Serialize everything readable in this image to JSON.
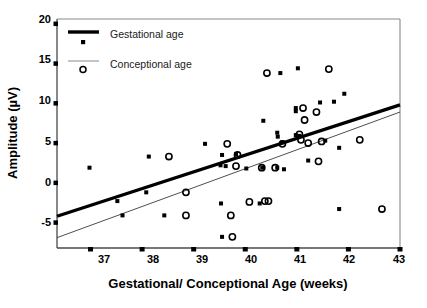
{
  "chart_data": {
    "type": "scatter",
    "title": "",
    "xlabel": "Gestational/ Conceptional Age (weeks)",
    "ylabel": "Amplitude (µV)",
    "xlim": [
      36.35,
      43.0
    ],
    "ylim": [
      -8.2,
      20.6
    ],
    "xticks": [
      37,
      38,
      39,
      40,
      41,
      42,
      43
    ],
    "xtick_labels": [
      "37",
      "38",
      "39",
      "40",
      "41",
      "42",
      "43"
    ],
    "yticks": [
      20,
      15,
      10,
      5,
      0,
      -5
    ],
    "ytick_labels": [
      "20",
      "15",
      "10",
      "5",
      "0",
      "-5"
    ],
    "grid": false,
    "legend_position": "top-left",
    "series": [
      {
        "name": "Gestational age",
        "marker": "square",
        "color": "#000000",
        "points": [
          [
            36.98,
            1.9
          ],
          [
            37.52,
            -2.3
          ],
          [
            37.62,
            -4.1
          ],
          [
            38.08,
            -1.2
          ],
          [
            38.13,
            3.3
          ],
          [
            38.43,
            -4.1
          ],
          [
            39.22,
            4.9
          ],
          [
            39.52,
            2.2
          ],
          [
            39.55,
            3.5
          ],
          [
            39.53,
            -2.6
          ],
          [
            39.55,
            -6.8
          ],
          [
            39.82,
            3.6
          ],
          [
            40.02,
            1.8
          ],
          [
            40.33,
            1.9
          ],
          [
            40.35,
            7.8
          ],
          [
            40.62,
            6.3
          ],
          [
            40.63,
            5.8
          ],
          [
            40.72,
            5.1
          ],
          [
            40.98,
            9.4
          ],
          [
            40.98,
            9.0
          ],
          [
            40.98,
            6.0
          ],
          [
            41.02,
            14.4
          ],
          [
            41.05,
            5.9
          ],
          [
            41.22,
            2.8
          ],
          [
            41.45,
            10.1
          ],
          [
            41.55,
            5.3
          ],
          [
            41.72,
            10.2
          ],
          [
            41.82,
            4.4
          ],
          [
            41.82,
            -3.3
          ],
          [
            41.92,
            11.2
          ],
          [
            40.68,
            13.8
          ],
          [
            39.62,
            2.1
          ],
          [
            40.62,
            1.9
          ],
          [
            40.75,
            1.7
          ],
          [
            40.28,
            -2.6
          ]
        ]
      },
      {
        "name": "Conceptional age",
        "marker": "circle",
        "color": "#000000",
        "points": [
          [
            38.52,
            3.3
          ],
          [
            38.85,
            -1.2
          ],
          [
            38.85,
            -4.1
          ],
          [
            39.65,
            4.9
          ],
          [
            39.72,
            -4.1
          ],
          [
            39.75,
            -6.8
          ],
          [
            39.82,
            2.1
          ],
          [
            39.85,
            3.5
          ],
          [
            40.08,
            -2.4
          ],
          [
            40.32,
            1.9
          ],
          [
            40.45,
            -2.3
          ],
          [
            40.42,
            13.8
          ],
          [
            40.58,
            1.9
          ],
          [
            41.05,
            6.1
          ],
          [
            41.08,
            5.4
          ],
          [
            41.12,
            9.4
          ],
          [
            41.15,
            7.9
          ],
          [
            41.22,
            5.0
          ],
          [
            41.38,
            8.9
          ],
          [
            41.42,
            2.7
          ],
          [
            41.48,
            5.2
          ],
          [
            41.62,
            14.3
          ],
          [
            42.22,
            5.4
          ],
          [
            42.65,
            -3.3
          ],
          [
            40.72,
            4.9
          ],
          [
            40.38,
            -2.3
          ]
        ]
      }
    ],
    "trendlines": [
      {
        "name": "Gestational age",
        "style": "thick",
        "width": 3.2,
        "color": "#000000",
        "x0": 36.35,
        "y0": -4.2,
        "x1": 43.0,
        "y1": 9.8
      },
      {
        "name": "Conceptional age",
        "style": "thin",
        "width": 0.9,
        "color": "#3a3a3a",
        "x0": 36.35,
        "y0": -6.9,
        "x1": 43.0,
        "y1": 8.9
      }
    ],
    "legend": [
      {
        "label": "Gestational age",
        "marker": "square",
        "line": "thick"
      },
      {
        "label": "Conceptional age",
        "marker": "circle",
        "line": "thin"
      }
    ]
  },
  "axes": {
    "x_axis_title": "Gestational/ Conceptional Age (weeks)",
    "y_axis_title": "Amplitude (µV)"
  },
  "legend": {
    "item0_label": "Gestational age",
    "item1_label": "Conceptional age"
  },
  "xtick_labels": {
    "t0": "37",
    "t1": "38",
    "t2": "39",
    "t3": "40",
    "t4": "41",
    "t5": "42",
    "t6": "43"
  },
  "ytick_labels": {
    "t0": "20",
    "t1": "15",
    "t2": "10",
    "t3": "5",
    "t4": "0",
    "t5": "-5"
  }
}
